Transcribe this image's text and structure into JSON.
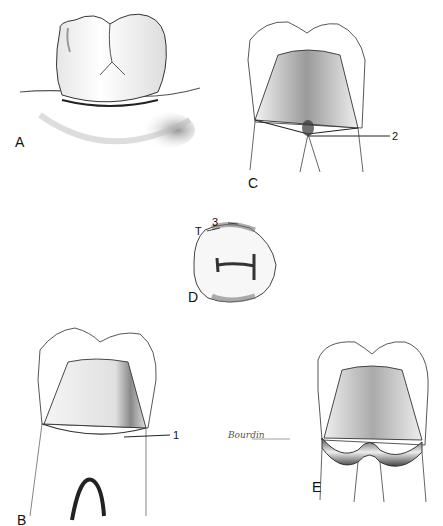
{
  "figure": {
    "panels": [
      {
        "id": "A",
        "label": "A",
        "description": "Occlusal/buccal view of molar crown seated at gingiva"
      },
      {
        "id": "B",
        "label": "B",
        "description": "Tooth preparation with margin line",
        "callouts": [
          {
            "number": "1"
          }
        ]
      },
      {
        "id": "C",
        "label": "C",
        "description": "Tooth preparation with margin at furcation",
        "callouts": [
          {
            "number": "2"
          }
        ]
      },
      {
        "id": "D",
        "label": "D",
        "description": "Occlusal view of preparation",
        "callouts": [
          {
            "number": "3"
          },
          {
            "number": "T"
          }
        ]
      },
      {
        "id": "E",
        "label": "E",
        "description": "Preparation with band around cervical margin"
      }
    ],
    "signature": "Bourdin",
    "colors": {
      "background": "#ffffff",
      "line": "#222222",
      "shade": "#8a8a8a",
      "label": "#111111"
    }
  }
}
